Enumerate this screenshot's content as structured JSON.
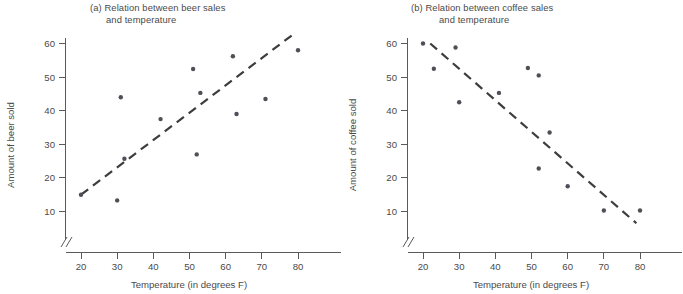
{
  "figure": {
    "background": "#ffffff",
    "point_color": "#4f4f57",
    "line_color": "#3d3d3d",
    "axis_color": "#5a5a5a"
  },
  "panel_a": {
    "title_line1": "(a) Relation between beer sales",
    "title_line2": "and temperature",
    "xlabel": "Temperature (in degrees F)",
    "ylabel": "Amount of beer sold",
    "xticks": [
      "20",
      "30",
      "40",
      "50",
      "60",
      "70",
      "80"
    ],
    "yticks": [
      "10",
      "20",
      "30",
      "40",
      "50",
      "60"
    ]
  },
  "panel_b": {
    "title_line1": "(b) Relation between coffee sales",
    "title_line2": "and temperature",
    "xlabel": "Temperature (in degrees F)",
    "ylabel": "Amount of coffee sold",
    "xticks": [
      "20",
      "30",
      "40",
      "50",
      "60",
      "70",
      "80"
    ],
    "yticks": [
      "10",
      "20",
      "30",
      "40",
      "50",
      "60"
    ]
  },
  "chart_data": [
    {
      "type": "scatter",
      "panel": "a",
      "title": "(a) Relation between beer sales and temperature",
      "xlabel": "Temperature (in degrees F)",
      "ylabel": "Amount of beer sold",
      "xlim": [
        18,
        84
      ],
      "ylim": [
        4,
        64
      ],
      "xticks": [
        20,
        30,
        40,
        50,
        60,
        70,
        80
      ],
      "yticks": [
        10,
        20,
        30,
        40,
        50,
        60
      ],
      "grid": false,
      "legend": "none",
      "axis_break_x": true,
      "axis_break_y": true,
      "points": [
        {
          "x": 20,
          "y": 15.0
        },
        {
          "x": 30,
          "y": 13.3
        },
        {
          "x": 31,
          "y": 44.0
        },
        {
          "x": 32,
          "y": 25.7
        },
        {
          "x": 42,
          "y": 37.5
        },
        {
          "x": 51,
          "y": 52.4
        },
        {
          "x": 52,
          "y": 27.0
        },
        {
          "x": 53,
          "y": 45.3
        },
        {
          "x": 62,
          "y": 56.2
        },
        {
          "x": 63,
          "y": 39.0
        },
        {
          "x": 71,
          "y": 43.5
        },
        {
          "x": 80,
          "y": 58.0
        }
      ],
      "trendline": {
        "style": "dashed",
        "direction": "positive",
        "x_start": 20,
        "y_start": 15.0,
        "x_end": 79,
        "y_end": 63.0
      }
    },
    {
      "type": "scatter",
      "panel": "b",
      "title": "(b) Relation between coffee sales and temperature",
      "xlabel": "Temperature (in degrees F)",
      "ylabel": "Amount of coffee sold",
      "xlim": [
        18,
        84
      ],
      "ylim": [
        4,
        64
      ],
      "xticks": [
        20,
        30,
        40,
        50,
        60,
        70,
        80
      ],
      "yticks": [
        10,
        20,
        30,
        40,
        50,
        60
      ],
      "grid": false,
      "legend": "none",
      "axis_break_x": true,
      "axis_break_y": true,
      "points": [
        {
          "x": 20,
          "y": 60.0
        },
        {
          "x": 23,
          "y": 52.5
        },
        {
          "x": 29,
          "y": 58.8
        },
        {
          "x": 30,
          "y": 42.5
        },
        {
          "x": 41,
          "y": 45.3
        },
        {
          "x": 49,
          "y": 52.7
        },
        {
          "x": 52,
          "y": 50.5
        },
        {
          "x": 52,
          "y": 22.8
        },
        {
          "x": 55,
          "y": 33.5
        },
        {
          "x": 60,
          "y": 17.5
        },
        {
          "x": 70,
          "y": 10.3
        },
        {
          "x": 80,
          "y": 10.3
        }
      ],
      "trendline": {
        "style": "dashed",
        "direction": "negative",
        "x_start": 22,
        "y_start": 60.0,
        "x_end": 79,
        "y_end": 6.5
      }
    }
  ]
}
